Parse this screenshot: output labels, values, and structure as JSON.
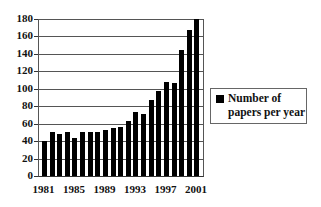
{
  "chart_data": {
    "type": "bar",
    "title": "",
    "xlabel": "",
    "ylabel": "",
    "categories": [
      "1981",
      "1982",
      "1983",
      "1984",
      "1985",
      "1986",
      "1987",
      "1988",
      "1989",
      "1990",
      "1991",
      "1992",
      "1993",
      "1994",
      "1995",
      "1996",
      "1997",
      "1998",
      "1999",
      "2000",
      "2001"
    ],
    "series": [
      {
        "name": "Number of papers per year",
        "values": [
          40,
          50,
          48,
          50,
          44,
          51,
          50,
          51,
          53,
          55,
          56,
          63,
          73,
          71,
          87,
          97,
          108,
          107,
          144,
          167,
          180
        ],
        "color": "#000000"
      }
    ],
    "ylim": [
      0,
      180
    ],
    "yticks": [
      0,
      20,
      40,
      60,
      80,
      100,
      120,
      140,
      160,
      180
    ],
    "xtick_labels": [
      "1981",
      "1985",
      "1989",
      "1993",
      "1997",
      "2001"
    ],
    "grid": true,
    "legend_position": "right"
  },
  "legend": {
    "line1": "Number of",
    "line2": "papers per year"
  }
}
